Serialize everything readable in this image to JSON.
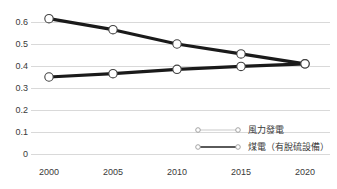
{
  "chart_data": {
    "type": "line",
    "title": "",
    "subtitle": "",
    "xlabel": "",
    "ylabel": "",
    "x": [
      "2000",
      "2005",
      "2010",
      "2015",
      "2020"
    ],
    "categories": [
      "2000",
      "2005",
      "2010",
      "2015",
      "2020"
    ],
    "series": [
      {
        "name": "風力發電",
        "values": [
          0.35,
          0.365,
          0.385,
          0.398,
          0.41
        ],
        "color": "#1a1a1a",
        "legend_line_color": "#c9c9c9",
        "marker": "open-circle"
      },
      {
        "name": "煤電（有脫硫設備）",
        "values": [
          0.615,
          0.565,
          0.5,
          0.455,
          0.41
        ],
        "color": "#1a1a1a",
        "legend_line_color": "#5a5a5a",
        "marker": "open-circle"
      }
    ],
    "ylim": [
      0,
      0.65
    ],
    "yticks": [
      "0",
      "0.1",
      "0.2",
      "0.3",
      "0.4",
      "0.5",
      "0.6"
    ],
    "ytick_values": [
      0,
      0.1,
      0.2,
      0.3,
      0.4,
      0.5,
      0.6
    ],
    "xticks": [
      "2000",
      "2005",
      "2010",
      "2015",
      "2020"
    ],
    "grid": "horizontal",
    "legend_position": "inside-lower-right",
    "gridline_color": "#d9d9d9",
    "axis_color": "#d9d9d9",
    "marker_fill": "#ffffff",
    "marker_edge": "#404040",
    "background": "#ffffff"
  },
  "legend": {
    "entries": [
      {
        "label": "風力發電"
      },
      {
        "label": "煤電（有脫硫設備）"
      }
    ]
  },
  "axes": {
    "y": {
      "labels": [
        "0.6",
        "0.5",
        "0.4",
        "0.3",
        "0.2",
        "0.1",
        "0"
      ]
    },
    "x": {
      "labels": [
        "2000",
        "2005",
        "2010",
        "2015",
        "2020"
      ]
    }
  }
}
